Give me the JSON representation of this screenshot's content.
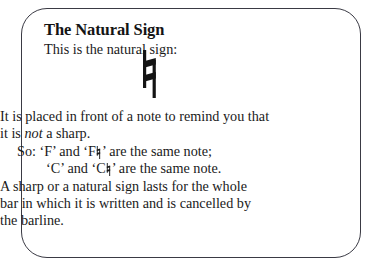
{
  "card": {
    "border_color": "#3a3a44",
    "background": "#ffffff",
    "text_color": "#1a1a1a"
  },
  "heading": {
    "title": "The Natural Sign",
    "subtitle": "This is the natural sign:"
  },
  "figure": {
    "symbol_name": "natural-sign",
    "symbol_char": "♮"
  },
  "body": {
    "line1": "It is placed in front of a note to remind you that",
    "line2_prefix": "it is ",
    "line2_italic": "not",
    "line2_suffix": " a sharp.",
    "line3_prefix": "So: ‘F’ and ‘F",
    "line3_suffix": "’ are the same note;",
    "line4_prefix": "‘C’ and ‘C",
    "line4_suffix": "’ are the same note.",
    "line5": "A sharp or a natural sign lasts for the whole",
    "line6": "bar in which it is written and is cancelled by",
    "line7": "the barline."
  }
}
